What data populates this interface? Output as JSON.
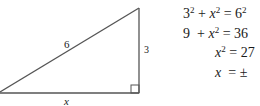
{
  "diagram": {
    "type": "right-triangle",
    "labels": {
      "hypotenuse": "6",
      "vertical_leg": "3",
      "horizontal_leg": "x"
    },
    "right_angle_marker": "bottom-right"
  },
  "equations": [
    {
      "lhs_a": "3",
      "lhs_a_exp": "2",
      "op": "+",
      "var": "x",
      "var_exp": "2",
      "eq": "=",
      "rhs": "6",
      "rhs_exp": "2"
    },
    {
      "lhs_a": "9",
      "op": "+",
      "var": "x",
      "var_exp": "2",
      "eq": "=",
      "rhs": "36"
    },
    {
      "var": "x",
      "var_exp": "2",
      "eq": "=",
      "rhs": "27"
    },
    {
      "var": "x",
      "eq": "=",
      "rhs": "±"
    }
  ]
}
